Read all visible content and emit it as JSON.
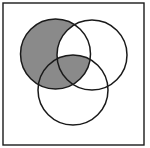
{
  "diagram": {
    "type": "venn",
    "sets": 3,
    "frame": {
      "x": 3,
      "y": 3,
      "width": 141,
      "height": 142,
      "stroke": "#1a1a1a"
    },
    "circles": [
      {
        "id": "A",
        "cx": 55.5,
        "cy": 54,
        "r": 35
      },
      {
        "id": "B",
        "cx": 92,
        "cy": 55,
        "r": 35
      },
      {
        "id": "C",
        "cx": 73,
        "cy": 90,
        "r": 35
      }
    ],
    "shaded_regions": [
      "A only",
      "A∩C only",
      "A∩B∩C"
    ],
    "shaded_expression": "(A − B) ∪ (A ∩ C)",
    "colors": {
      "shade": "#8a8a8a",
      "stroke": "#1a1a1a",
      "background": "#ffffff"
    }
  }
}
